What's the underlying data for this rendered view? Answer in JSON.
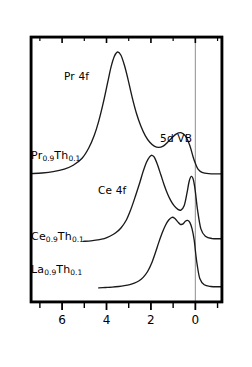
{
  "figure": {
    "title": "hν=70 eV",
    "xlabel": "BINDING  ENERGY  (eV)",
    "ylabel": "INTENSITY  (arb. u.)"
  },
  "axis": {
    "x_ticks": [
      "6",
      "4",
      "2",
      "0"
    ],
    "x_tick_values": [
      6,
      4,
      2,
      0
    ],
    "x_minor_values": [
      7,
      5,
      3,
      1,
      -1
    ],
    "x_range": [
      7.4,
      -1.2
    ],
    "fermi_level_label": "0",
    "fermi_line_color": "#999999",
    "frame_color": "#000000",
    "curve_color": "#1a1a1a"
  },
  "annotations": [
    {
      "id": "pr4f",
      "text": "Pr 4f",
      "x": 64,
      "y": 71
    },
    {
      "id": "5dvb",
      "text": "5d VB",
      "x": 160,
      "y": 133
    },
    {
      "id": "ce4f",
      "text": "Ce 4f",
      "x": 98,
      "y": 185
    }
  ],
  "samples": [
    {
      "id": "pr",
      "element": "Pr",
      "sub1": "0.9",
      "element2": "Th",
      "sub2": "0.1",
      "x": 31,
      "y": 150
    },
    {
      "id": "ce",
      "element": "Ce",
      "sub1": "0.9",
      "element2": "Th",
      "sub2": "0.1",
      "x": 31,
      "y": 231
    },
    {
      "id": "la",
      "element": "La",
      "sub1": "0.9",
      "element2": "Th",
      "sub2": "0.1",
      "x": 31,
      "y": 264
    }
  ],
  "chart_data": {
    "type": "line",
    "title": "hν=70 eV",
    "xlabel": "BINDING  ENERGY  (eV)",
    "ylabel": "INTENSITY  (arb. u.)",
    "xlim": [
      7.4,
      -1.2
    ],
    "x_ticks": [
      6,
      4,
      2,
      0
    ],
    "grid": false,
    "legend": "inline-curve-labels",
    "series": [
      {
        "name": "Pr0.9Th0.1",
        "label": "Pr₀.₉Th₀.₁",
        "features": [
          "Pr 4f peak at 3.5 eV",
          "5d VB band near 1 eV",
          "Fermi edge at 0 eV"
        ],
        "x": [
          7.4,
          6.9,
          6.4,
          5.9,
          5.5,
          5.1,
          4.8,
          4.55,
          4.35,
          4.15,
          3.95,
          3.8,
          3.65,
          3.5,
          3.35,
          3.2,
          3.05,
          2.85,
          2.65,
          2.45,
          2.25,
          2.05,
          1.85,
          1.65,
          1.45,
          1.25,
          1.05,
          0.85,
          0.65,
          0.45,
          0.25,
          0.1,
          0.0,
          -0.12,
          -0.3,
          -0.6,
          -1.0,
          -1.2
        ],
        "y": [
          0.05,
          0.055,
          0.065,
          0.085,
          0.115,
          0.17,
          0.25,
          0.35,
          0.46,
          0.6,
          0.76,
          0.88,
          0.965,
          1.0,
          0.975,
          0.9,
          0.8,
          0.65,
          0.52,
          0.42,
          0.345,
          0.295,
          0.265,
          0.255,
          0.265,
          0.295,
          0.33,
          0.36,
          0.37,
          0.345,
          0.27,
          0.18,
          0.13,
          0.085,
          0.06,
          0.05,
          0.048,
          0.048
        ]
      },
      {
        "name": "Ce0.9Th0.1",
        "label": "Ce₀.₉Th₀.₁",
        "features": [
          "Ce 4f main peak at 2 eV",
          "Ce 4f near-E_F peak at 0.3 eV",
          "Fermi edge at 0 eV"
        ],
        "x": [
          5.05,
          4.7,
          4.4,
          4.1,
          3.85,
          3.6,
          3.35,
          3.1,
          2.9,
          2.7,
          2.5,
          2.35,
          2.2,
          2.05,
          1.95,
          1.85,
          1.7,
          1.55,
          1.4,
          1.25,
          1.1,
          0.95,
          0.8,
          0.65,
          0.5,
          0.38,
          0.28,
          0.18,
          0.08,
          0.0,
          -0.1,
          -0.25,
          -0.45,
          -0.75,
          -1.2
        ],
        "y": [
          0.04,
          0.045,
          0.055,
          0.07,
          0.095,
          0.13,
          0.185,
          0.275,
          0.39,
          0.53,
          0.68,
          0.8,
          0.9,
          0.96,
          0.975,
          0.955,
          0.87,
          0.76,
          0.65,
          0.555,
          0.48,
          0.425,
          0.39,
          0.38,
          0.43,
          0.56,
          0.69,
          0.745,
          0.7,
          0.58,
          0.38,
          0.175,
          0.095,
          0.07,
          0.068
        ]
      },
      {
        "name": "La0.9Th0.1",
        "label": "La₀.₉Th₀.₁",
        "features": [
          "Broad 5d valence band peaking near 1 eV",
          "shoulder at 0.4 eV",
          "sharp Fermi edge at 0 eV"
        ],
        "x": [
          4.35,
          4.05,
          3.75,
          3.45,
          3.2,
          2.95,
          2.75,
          2.55,
          2.35,
          2.15,
          1.95,
          1.8,
          1.65,
          1.5,
          1.35,
          1.2,
          1.05,
          0.92,
          0.8,
          0.68,
          0.55,
          0.45,
          0.35,
          0.25,
          0.15,
          0.05,
          0.0,
          -0.08,
          -0.2,
          -0.4,
          -0.7,
          -1.05,
          -1.2
        ],
        "y": [
          0.04,
          0.045,
          0.05,
          0.058,
          0.068,
          0.082,
          0.1,
          0.128,
          0.175,
          0.25,
          0.37,
          0.49,
          0.62,
          0.74,
          0.84,
          0.91,
          0.945,
          0.93,
          0.89,
          0.855,
          0.86,
          0.895,
          0.905,
          0.88,
          0.8,
          0.65,
          0.52,
          0.34,
          0.16,
          0.08,
          0.058,
          0.055,
          0.055
        ]
      }
    ]
  }
}
